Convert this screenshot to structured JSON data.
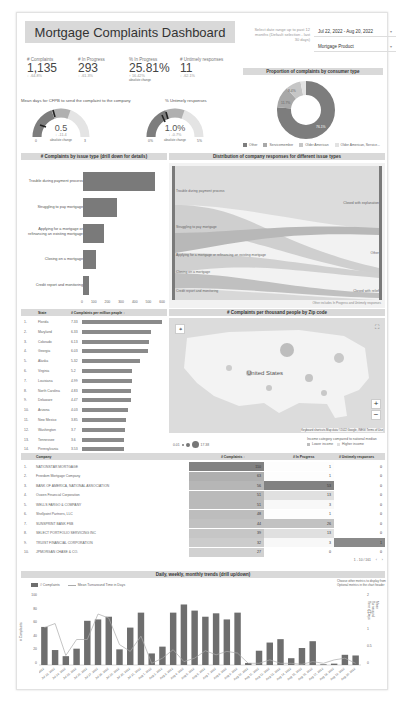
{
  "header": {
    "title": "Mortgage Complaints Dashboard",
    "date_label": "Select date range up to past 12 months (Default selection - last 30 days)",
    "date_value": "Jul 22, 2022 - Aug 20, 2022",
    "product_value": "Mortgage Product"
  },
  "kpis": [
    {
      "label": "# Complaints",
      "value": "1,135",
      "delta": "↓ -64.8%",
      "note": ""
    },
    {
      "label": "# In Progress",
      "value": "293",
      "delta": "↓ -61.3%",
      "note": ""
    },
    {
      "label": "% In Progress",
      "value": "25.81%",
      "delta": "↑ 16.42%",
      "note": "absolute change"
    },
    {
      "label": "# Untimely responses",
      "value": "11",
      "delta": "↓ -62.1%",
      "note": ""
    }
  ],
  "gauges": [
    {
      "title": "Mean days for CFPB to send the complaint to the company",
      "value": "0.5",
      "delta": "↓ -11.4",
      "note": "absolute change",
      "min": "0",
      "max": "3"
    },
    {
      "title": "% Untimely responses",
      "value": "1.0%",
      "delta": "↓ -0.7%",
      "note": "absolute change",
      "min": "0%",
      "max": "5%"
    }
  ],
  "donut": {
    "title": "Proportion of complaints by consumer type",
    "slices": [
      {
        "name": "Other",
        "pct": 76.1,
        "label": "76.1%",
        "color": "#7d7d7d"
      },
      {
        "name": "Servicemember",
        "pct": 11.7,
        "label": "11.7%",
        "color": "#a8a8a8"
      },
      {
        "name": "Older American",
        "pct": 8.4,
        "label": "8.4%",
        "color": "#c6c6c6"
      },
      {
        "name": "Older American, Service...",
        "pct": 3.8,
        "label": "",
        "color": "#e2e2e2"
      }
    ],
    "legend": [
      "Other",
      "Servicemember",
      "Older American",
      "Older American, Service..."
    ]
  },
  "issue_chart": {
    "title": "# Complaints by issue type (drill down for details)",
    "issues": [
      {
        "label": "Trouble during payment process",
        "value": 557
      },
      {
        "label": "Struggling to pay mortgage",
        "value": 263
      },
      {
        "label": "Applying for a mortgage or refinancing an existing mortgage",
        "value": 160
      },
      {
        "label": "Closing on a mortgage",
        "value": 100
      },
      {
        "label": "Credit report and monitoring",
        "value": 42
      }
    ],
    "ticks": [
      "0",
      "100",
      "200",
      "300",
      "400",
      "500",
      "600"
    ]
  },
  "sankey": {
    "title": "Distribution of company responses for different issue types",
    "left": [
      "Trouble during payment process",
      "Struggling to pay mortgage",
      "Applying for a mortgage or refinancing an existing mortgage",
      "Closing on a mortgage",
      "Credit report and monitoring"
    ],
    "right": [
      "Closed with explanation",
      "Other",
      "Closed with relief"
    ],
    "footnote": "Other includes In Progress and Untimely responses"
  },
  "states": {
    "col_state": "State",
    "col_metric": "# Complaints per million people ↓",
    "rows": [
      {
        "rank": "1.",
        "state": "Florida",
        "value": "7.33",
        "width": 100
      },
      {
        "rank": "2.",
        "state": "Maryland",
        "value": "6.33",
        "width": 86
      },
      {
        "rank": "3.",
        "state": "Colorado",
        "value": "6.13",
        "width": 84
      },
      {
        "rank": "4.",
        "state": "Georgia",
        "value": "6.03",
        "width": 82
      },
      {
        "rank": "5.",
        "state": "Alaska",
        "value": "5.32",
        "width": 73
      },
      {
        "rank": "6.",
        "state": "Virginia",
        "value": "5.2",
        "width": 63
      },
      {
        "rank": "7.",
        "state": "Louisiana",
        "value": "4.99",
        "width": 62
      },
      {
        "rank": "8.",
        "state": "North Carolina",
        "value": "4.83",
        "width": 61
      },
      {
        "rank": "9.",
        "state": "Delaware",
        "value": "4.47",
        "width": 61
      },
      {
        "rank": "10.",
        "state": "Arizona",
        "value": "4.03",
        "width": 58
      },
      {
        "rank": "11.",
        "state": "New Mexico",
        "value": "3.85",
        "width": 55
      },
      {
        "rank": "12.",
        "state": "Washington",
        "value": "3.7",
        "width": 54
      },
      {
        "rank": "13.",
        "state": "Tennessee",
        "value": "3.6",
        "width": 53
      },
      {
        "rank": "14.",
        "state": "Pennsylvania",
        "value": "3.53",
        "width": 52
      }
    ]
  },
  "map": {
    "title": "# Complaints per thousand people by Zip code",
    "country_label": "United States",
    "attribution": "Keyboard shortcuts   Map data ©2022 Google, INEGI   Terms of Use",
    "size_min": "0.01",
    "size_max": "17.38",
    "legend_title": "Income category compared to national median",
    "legend_items": [
      "Lower income",
      "Higher income"
    ],
    "zoom_in": "+",
    "zoom_out": "−"
  },
  "companies": {
    "col_company": "Company",
    "col_complaints": "# Complaints ↓",
    "col_progress": "# In Progress",
    "col_untimely": "# Untimely responses",
    "rows": [
      {
        "rank": "1.",
        "name": "NATIONSTAR MORTGAGE",
        "complaints": "110",
        "progress": "1",
        "untimely": "0"
      },
      {
        "rank": "2.",
        "name": "Freedom Mortgage Company",
        "complaints": "63",
        "progress": "1",
        "untimely": "0"
      },
      {
        "rank": "3.",
        "name": "BANK OF AMERICA, NATIONAL ASSOCIATION",
        "complaints": "56",
        "progress": "53",
        "untimely": "0"
      },
      {
        "rank": "4.",
        "name": "Ocwen Financial Corporation",
        "complaints": "51",
        "progress": "13",
        "untimely": "0"
      },
      {
        "rank": "5.",
        "name": "WELLS FARGO & COMPANY",
        "complaints": "51",
        "progress": "3",
        "untimely": "0"
      },
      {
        "rank": "6.",
        "name": "Shellpoint Partners, LLC",
        "complaints": "48",
        "progress": "1",
        "untimely": "0"
      },
      {
        "rank": "7.",
        "name": "SUNSPRINT BANK FSB",
        "complaints": "44",
        "progress": "26",
        "untimely": "0"
      },
      {
        "rank": "8.",
        "name": "SELECT PORTFOLIO SERVICING INC",
        "complaints": "39",
        "progress": "13",
        "untimely": "0"
      },
      {
        "rank": "9.",
        "name": "TRUIST FINANCIAL CORPORATION",
        "complaints": "32",
        "progress": "3",
        "untimely": "1"
      },
      {
        "rank": "10.",
        "name": "JPMORGAN CHASE & CO.",
        "complaints": "27",
        "progress": "0",
        "untimely": "0"
      }
    ],
    "pagination": "1 - 10 / 161"
  },
  "trends": {
    "title": "Daily, weekly, monthly trends (drill up/down)",
    "legend_bar": "# Complaints",
    "legend_line": "Mean Turnaround Time in Days",
    "note": "Choose other metrics to display from Optional metrics in the chart header",
    "y_left_label": "# Complaints",
    "y_right_label": "Mean Turnaround Time in Days",
    "y_left_ticks": [
      "0",
      "20",
      "40",
      "60",
      "80",
      "100"
    ],
    "y_right_ticks": [
      "0",
      "0.5",
      "1",
      "1.5",
      "2"
    ]
  },
  "chart_data": {
    "type": "bar",
    "title": "Daily, weekly, monthly trends (drill up/down)",
    "xlabel": "",
    "ylabel": "# Complaints",
    "ylim": [
      0,
      100
    ],
    "categories": [
      "Jul 22, 2022",
      "Jul 23, 2022",
      "Jul 24, 2022",
      "Jul 25, 2022",
      "Jul 26, 2022",
      "Jul 27, 2022",
      "Jul 28, 2022",
      "Jul 29, 2022",
      "Jul 30, 2022",
      "Jul 31, 2022",
      "Aug 1, 2022",
      "Aug 2, 2022",
      "Aug 3, 2022",
      "Aug 4, 2022",
      "Aug 5, 2022",
      "Aug 6, 2022",
      "Aug 7, 2022",
      "Aug 8, 2022",
      "Aug 9, 2022",
      "Aug 10, 2022",
      "Aug 11, 2022",
      "Aug 12, 2022",
      "Aug 13, 2022",
      "Aug 14, 2022",
      "Aug 15, 2022",
      "Aug 16, 2022",
      "Aug 17, 2022",
      "Aug 18, 2022",
      "Aug 19, 2022",
      "Aug 20, 2022"
    ],
    "series": [
      {
        "name": "# Complaints",
        "values": [
          56,
          22,
          13,
          24,
          65,
          67,
          71,
          23,
          55,
          77,
          17,
          27,
          77,
          89,
          80,
          71,
          76,
          67,
          77,
          3,
          21,
          33,
          38,
          10,
          25,
          35,
          1,
          2,
          15,
          14
        ]
      },
      {
        "name": "Mean Turnaround Time in Days",
        "axis": "right",
        "values": [
          1.1,
          1.22,
          0.28,
          0.75,
          0.75,
          1.5,
          1.38,
          0.6,
          0.4,
          0.85,
          0.05,
          0.2,
          0.45,
          0.1,
          0.2,
          0.42,
          0.3,
          0.4,
          0.35,
          0.05,
          0.05,
          0.15,
          0.05,
          0.05,
          0.02,
          0.1,
          0.05,
          0.15,
          0.2,
          0.05
        ]
      }
    ],
    "y2lim": [
      0,
      2
    ],
    "legend_position": "top-left",
    "grid": false
  }
}
